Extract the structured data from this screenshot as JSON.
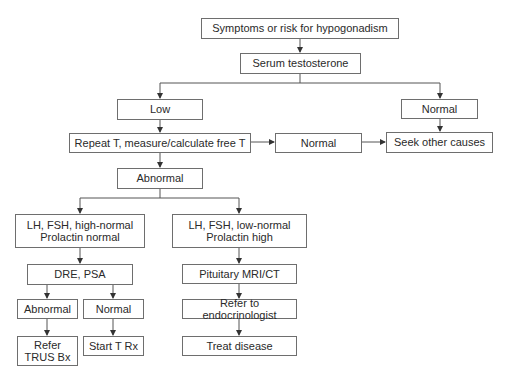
{
  "diagram": {
    "nodes": {
      "symptoms": "Symptoms or risk for hypogonadism",
      "serum": "Serum testosterone",
      "low": "Low",
      "normal_top": "Normal",
      "repeat": "Repeat T, measure/calculate free T",
      "normal_mid": "Normal",
      "seek": "Seek other causes",
      "abnormal": "Abnormal",
      "lh_high": "LH, FSH, high-normal\nProlactin normal",
      "lh_low": "LH, FSH, low-normal\nProlactin high",
      "dre": "DRE, PSA",
      "pituitary": "Pituitary MRI/CT",
      "abnormal2": "Abnormal",
      "normal2": "Normal",
      "refer_endo": "Refer to endocrinologist",
      "refer_trus": "Refer\nTRUS Bx",
      "start_t": "Start T Rx",
      "treat": "Treat disease"
    },
    "edges": [
      [
        "symptoms",
        "serum"
      ],
      [
        "serum",
        "low"
      ],
      [
        "serum",
        "normal_top"
      ],
      [
        "low",
        "repeat"
      ],
      [
        "normal_top",
        "seek"
      ],
      [
        "repeat",
        "normal_mid"
      ],
      [
        "normal_mid",
        "seek"
      ],
      [
        "repeat",
        "abnormal"
      ],
      [
        "abnormal",
        "lh_high"
      ],
      [
        "abnormal",
        "lh_low"
      ],
      [
        "lh_high",
        "dre"
      ],
      [
        "lh_low",
        "pituitary"
      ],
      [
        "dre",
        "abnormal2"
      ],
      [
        "dre",
        "normal2"
      ],
      [
        "abnormal2",
        "refer_trus"
      ],
      [
        "normal2",
        "start_t"
      ],
      [
        "pituitary",
        "refer_endo"
      ],
      [
        "refer_endo",
        "treat"
      ]
    ],
    "colors": {
      "line": "#555555",
      "border": "#6e6e6e",
      "text": "#2a2a2a"
    }
  }
}
